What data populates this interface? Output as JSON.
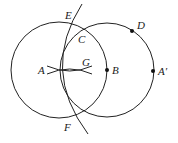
{
  "diagram": {
    "labels": {
      "A": "A",
      "B": "B",
      "C": "C",
      "D": "D",
      "E": "E",
      "F": "F",
      "G": "G",
      "A_prime": "A′"
    },
    "colors": {
      "stroke": "#222222",
      "background": "#ffffff"
    }
  }
}
